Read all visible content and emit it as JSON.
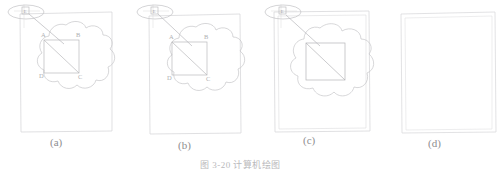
{
  "figure": {
    "caption": "图 3-20  计算机绘图",
    "panels": [
      {
        "id": "a",
        "label": "(a)",
        "frame_style": "single",
        "has_cloud": true,
        "has_square": true,
        "has_diagonal": true,
        "has_callout": true,
        "callout_label": "E",
        "vertex_labels": {
          "top_left": "A",
          "top_right": "B",
          "bottom_left": "D",
          "bottom_right": "C"
        }
      },
      {
        "id": "b",
        "label": "(b)",
        "frame_style": "single",
        "has_cloud": true,
        "has_square": true,
        "has_diagonal": true,
        "has_callout": true,
        "callout_label": "E",
        "vertex_labels": {
          "top_left": "A",
          "top_right": "B",
          "bottom_left": "D",
          "bottom_right": "C"
        }
      },
      {
        "id": "c",
        "label": "(c)",
        "frame_style": "double",
        "has_cloud": true,
        "has_square": true,
        "has_diagonal": true,
        "has_callout": true,
        "callout_label": "E",
        "vertex_labels": {
          "top_left": "",
          "top_right": "",
          "bottom_left": "",
          "bottom_right": ""
        }
      },
      {
        "id": "d",
        "label": "(d)",
        "frame_style": "double",
        "has_cloud": false,
        "has_square": false,
        "has_diagonal": false,
        "has_callout": false,
        "callout_label": "",
        "vertex_labels": {
          "top_left": "",
          "top_right": "",
          "bottom_left": "",
          "bottom_right": ""
        }
      }
    ]
  },
  "colors": {
    "frame_line": "#cfcfd2",
    "cloud_line": "#c2c2c5",
    "square_line": "#b6b6b9",
    "callout_line": "#bdbdc0",
    "text": "#8e8e90",
    "background": "#ffffff"
  }
}
